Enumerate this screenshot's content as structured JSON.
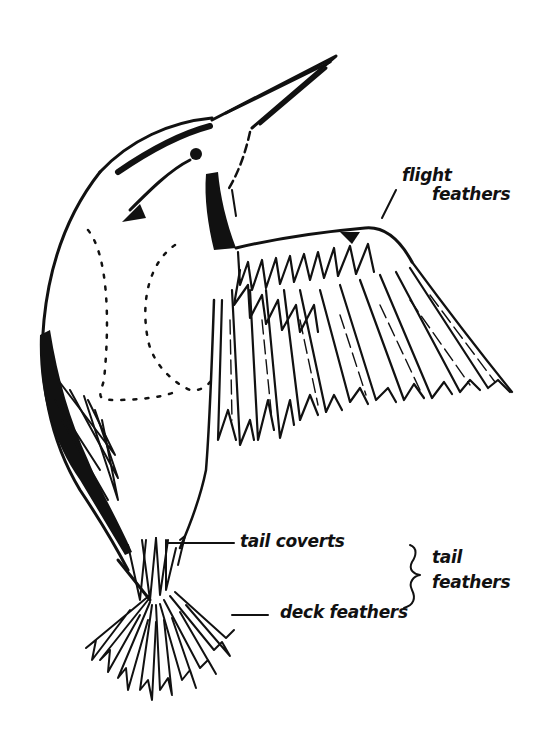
{
  "diagram": {
    "ink_color": "#111111",
    "background_color": "#ffffff"
  },
  "labels": {
    "flight_feathers": {
      "line1": "flight",
      "line2": "feathers"
    },
    "tail_coverts": "tail coverts",
    "tail_feathers": {
      "line1": "tail",
      "line2": "feathers"
    },
    "deck_feathers": "deck feathers"
  }
}
